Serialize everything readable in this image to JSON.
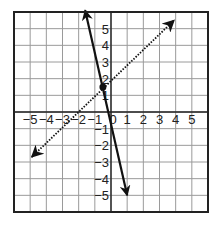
{
  "chart_data": {
    "type": "line",
    "title": "",
    "xlabel": "",
    "ylabel": "",
    "xlim": [
      -6,
      6
    ],
    "ylim": [
      -6,
      6
    ],
    "grid": true,
    "x_ticks": [
      "-5",
      "-4",
      "-3",
      "-2",
      "-1",
      "0",
      "1",
      "2",
      "3",
      "4",
      "5"
    ],
    "y_ticks": [
      "5",
      "4",
      "3",
      "2",
      "1",
      "-1",
      "-2",
      "-3",
      "-4",
      "-5"
    ],
    "series": [
      {
        "name": "solid line",
        "style": "solid",
        "arrows": "both",
        "equation": "y = -4x - 0.5",
        "x": [
          -1.6,
          1.0
        ],
        "y": [
          6.1,
          -5.0
        ]
      },
      {
        "name": "dotted line",
        "style": "dotted",
        "arrows": "both",
        "equation": "y = x + 2",
        "x": [
          -4.9,
          3.9
        ],
        "y": [
          -2.7,
          5.5
        ]
      }
    ],
    "points": [
      {
        "name": "intersection",
        "x": -0.5,
        "y": 1.5
      }
    ]
  },
  "colors": {
    "grid": "#9a9a9a",
    "axis": "#222222",
    "line": "#111111",
    "border": "#222222"
  }
}
